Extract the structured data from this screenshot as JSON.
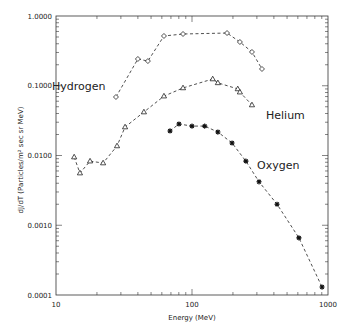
{
  "chart_data": {
    "type": "line",
    "title": "",
    "xlabel": "Energy (MeV)",
    "ylabel": "dJ/dT (Particles/m² sec sr MeV)",
    "xscale": "log",
    "yscale": "log",
    "xlim": [
      10,
      1000
    ],
    "ylim": [
      0.0001,
      1.0
    ],
    "x_tick_labels": [
      "10",
      "100",
      "1000"
    ],
    "y_tick_labels": [
      "1.0000",
      "0.1000",
      "0.0100",
      "0.0010",
      "0.0001"
    ],
    "grid": false,
    "legend": "inline labels",
    "series": [
      {
        "name": "Hydrogen",
        "marker": "diamond",
        "label_pos": {
          "x": 52,
          "y": 90
        },
        "x": [
          27.6,
          40,
          47.4,
          62.2,
          85.9,
          181,
          225,
          276,
          327
        ],
        "values": [
          0.069,
          0.242,
          0.226,
          0.517,
          0.552,
          0.57,
          0.424,
          0.305,
          0.174
        ]
      },
      {
        "name": "Helium",
        "marker": "triangle",
        "label_pos": {
          "x": 266,
          "y": 119
        },
        "x": [
          13.6,
          15.0,
          17.8,
          22.2,
          28.1,
          32.2,
          44.3,
          62.2,
          85.9,
          142,
          155,
          217,
          225,
          276
        ],
        "values": [
          0.0095,
          0.0056,
          0.0083,
          0.0078,
          0.0137,
          0.0256,
          0.042,
          0.071,
          0.093,
          0.125,
          0.11,
          0.09,
          0.081,
          0.053
        ]
      },
      {
        "name": "Oxygen",
        "marker": "asterisk",
        "label_pos": {
          "x": 257,
          "y": 169
        },
        "x": [
          68.9,
          80.2,
          100,
          124,
          155,
          197,
          249,
          311,
          422,
          611,
          904
        ],
        "values": [
          0.0225,
          0.0283,
          0.0264,
          0.0264,
          0.0217,
          0.0151,
          0.0083,
          0.0042,
          0.002,
          0.00066,
          0.00013
        ]
      }
    ]
  }
}
